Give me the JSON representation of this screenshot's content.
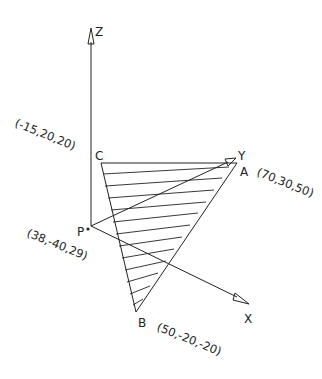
{
  "diagram": {
    "axes": {
      "z": {
        "label": "Z"
      },
      "y": {
        "label": "Y"
      },
      "x": {
        "label": "X"
      }
    },
    "points": {
      "origin": {
        "label": "P",
        "coords": "(38,-40,29)"
      },
      "A": {
        "label": "A",
        "coords": "(70,30,50)"
      },
      "B": {
        "label": "B",
        "coords": "(50,-20,-20)"
      },
      "C": {
        "label": "C",
        "coords": "(-15,20,20)"
      }
    },
    "colors": {
      "line": "#222222",
      "background": "#ffffff"
    }
  }
}
